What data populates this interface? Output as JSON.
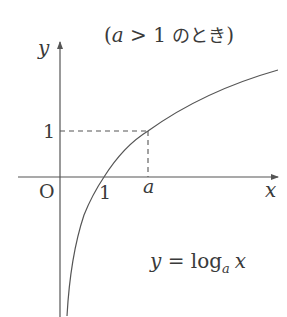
{
  "title": {
    "open": "(",
    "var": "a",
    "rel": " > 1 ",
    "jp": "のとき",
    "close": ")"
  },
  "axes": {
    "x_label": "x",
    "y_label": "y",
    "origin_label": "O"
  },
  "ticks": {
    "x_one": "1",
    "x_a": "a",
    "y_one": "1"
  },
  "equation": {
    "lhs": "y",
    "eq": " = log",
    "base": "a",
    "arg": "x"
  },
  "colors": {
    "stroke": "#555555",
    "text": "#3a3a3a"
  }
}
